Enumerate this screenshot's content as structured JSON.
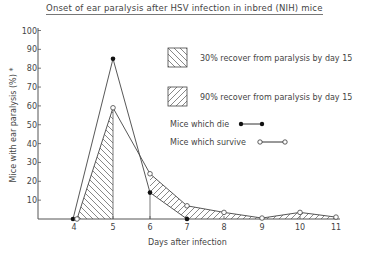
{
  "chart_data": {
    "type": "line",
    "title": "Onset of ear paralysis after HSV infection in inbred (NIH) mice",
    "xlabel": "Days after infection",
    "ylabel": "Mice with ear paralysis (%) *",
    "x": [
      4,
      5,
      6,
      7,
      8,
      9,
      10,
      11
    ],
    "xlim": [
      4,
      11
    ],
    "ylim": [
      0,
      100
    ],
    "yticks": [
      10,
      20,
      30,
      40,
      50,
      60,
      70,
      80,
      90,
      100
    ],
    "xticks": [
      4,
      5,
      6,
      7,
      8,
      9,
      10,
      11
    ],
    "grid": false,
    "series": [
      {
        "name": "Mice which die",
        "marker": "filled-circle",
        "x": [
          4,
          5,
          6,
          7
        ],
        "values": [
          0,
          85,
          14,
          0
        ]
      },
      {
        "name": "Mice which survive",
        "marker": "open-circle",
        "x": [
          4,
          5,
          6,
          7,
          8,
          9,
          10,
          11
        ],
        "values": [
          0,
          59,
          24,
          7,
          3.5,
          0.5,
          3.5,
          1
        ]
      }
    ],
    "shaded_regions": [
      {
        "name": "30% recover from paralysis by day 15",
        "pattern": "backslash-hatch",
        "from_day": 4,
        "to_day": 5
      },
      {
        "name": "90% recover from paralysis by day 15",
        "pattern": "forward-slash-hatch",
        "from_day": 6,
        "to_day": 11
      }
    ],
    "legend": [
      {
        "label": "30% recover from paralysis by day 15",
        "symbol": "hatch-backslash-box"
      },
      {
        "label": "90% recover from paralysis by day 15",
        "symbol": "hatch-slash-box"
      },
      {
        "label": "Mice which die",
        "symbol": "filled-circle-line"
      },
      {
        "label": "Mice which survive",
        "symbol": "open-circle-line"
      }
    ],
    "legend_position": "upper-right"
  }
}
